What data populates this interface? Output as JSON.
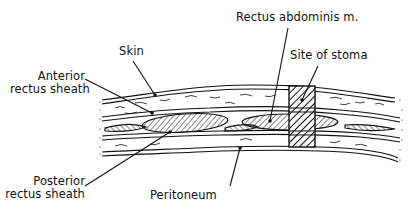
{
  "diagram": {
    "type": "anatomical cross-section",
    "labels": {
      "skin": "Skin",
      "anterior_rectus_sheath_line1": "Anterior",
      "anterior_rectus_sheath_line2": "rectus sheath",
      "rectus_abdominis": "Rectus abdominis m.",
      "site_of_stoma": "Site of stoma",
      "posterior_rectus_sheath_line1": "Posterior",
      "posterior_rectus_sheath_line2": "rectus sheath",
      "peritoneum": "Peritoneum"
    },
    "colors": {
      "ink": "#111111",
      "background": "#ffffff"
    }
  }
}
